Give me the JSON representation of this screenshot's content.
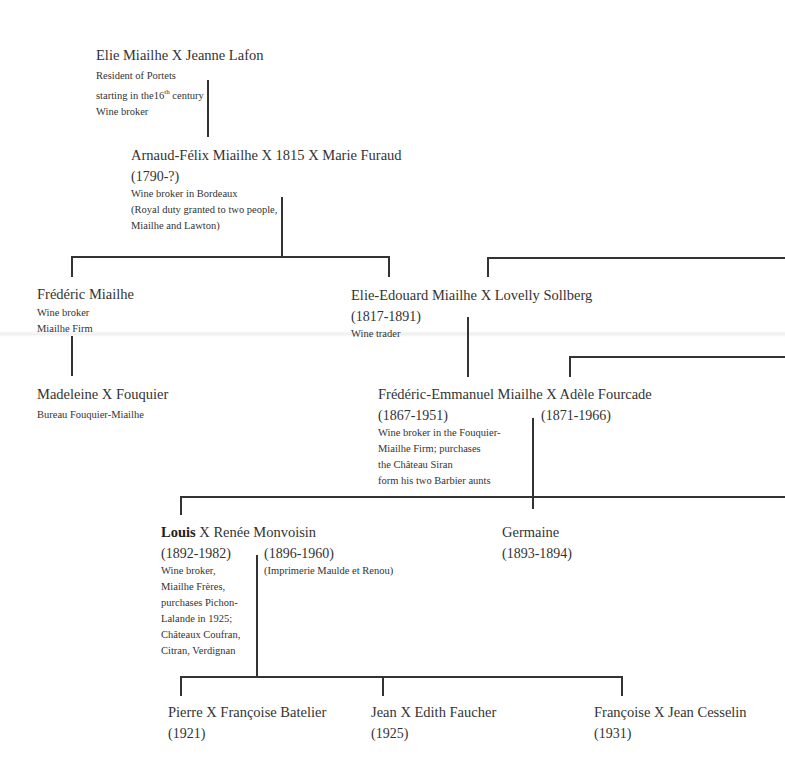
{
  "connector_color": "#333333",
  "nodes": {
    "elie": {
      "name": "Elie Miailhe X Jeanne Lafon",
      "details": [
        "Resident of Portets",
        "starting in the",
        "16",
        "th",
        " century",
        "Wine broker"
      ]
    },
    "arnaud": {
      "name": "Arnaud-Félix Miailhe X 1815 X Marie Furaud",
      "dates": "(1790-?)",
      "details": [
        "Wine broker in Bordeaux",
        "(Royal duty granted to two people,",
        "Miailhe and Lawton)"
      ]
    },
    "frederic": {
      "name": "Frédéric Miailhe",
      "details": [
        "Wine broker",
        "Miailhe Firm"
      ]
    },
    "elie_edouard": {
      "name": "Elie-Edouard Miailhe X Lovelly Sollberg",
      "dates": "(1817-1891)",
      "details": [
        "Wine trader"
      ]
    },
    "madeleine": {
      "name": "Madeleine X Fouquier",
      "details": [
        "Bureau Fouquier-Miailhe"
      ]
    },
    "frederic_emmanuel": {
      "name": "Frédéric-Emmanuel Miailhe X Adèle Fourcade",
      "dates": "(1867-1951)",
      "spouse_dates": "(1871-1966)",
      "details": [
        "Wine broker in the Fouquier-",
        "Miailhe Firm; purchases",
        "the Château Siran",
        "form his two Barbier aunts"
      ]
    },
    "louis": {
      "name_bold": "Louis",
      "name_rest": " X Renée Monvoisin",
      "dates": "(1892-1982)",
      "spouse_dates": "(1896-1960)",
      "spouse_details": [
        "(Imprimerie Maulde et Renou)"
      ],
      "details": [
        "Wine broker,",
        "Miailhe Frères,",
        "purchases Pichon-",
        "Lalande in 1925;",
        "Châteaux Coufran,",
        "Citran, Verdignan"
      ]
    },
    "germaine": {
      "name": "Germaine",
      "dates": "(1893-1894)"
    },
    "pierre": {
      "name": "Pierre X Françoise Batelier",
      "dates": "(1921)"
    },
    "jean": {
      "name": "Jean X Edith Faucher",
      "dates": "(1925)"
    },
    "francoise": {
      "name": "Françoise X Jean Cesselin",
      "dates": "(1931)"
    }
  }
}
